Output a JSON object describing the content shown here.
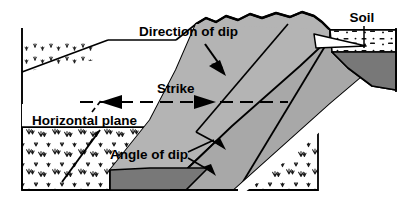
{
  "figure": {
    "type": "geologic-block-diagram",
    "width": 400,
    "height": 211
  },
  "labels": {
    "direction_of_dip": "Direction of dip",
    "strike": "Strike",
    "horizontal_plane": "Horizontal plane",
    "angle_of_dip": "Angle of dip",
    "soil": "Soil"
  },
  "colors": {
    "outline": "#000000",
    "background": "#ffffff",
    "bed_light_gray": "#b4b4b4",
    "bed_mid_gray": "#a8a8a8",
    "bed_dark_gray": "#787878",
    "soil_fill": "#ffffff",
    "text": "#000000"
  },
  "annotations": [
    {
      "name": "direction-of-dip",
      "text": "Direction of dip",
      "arrow": "down-right",
      "x": 139,
      "y": 32
    },
    {
      "name": "strike",
      "text": "Strike",
      "arrow": "double-horizontal",
      "x": 157,
      "y": 89
    },
    {
      "name": "horizontal-plane",
      "text": "Horizontal plane",
      "arrow": "dashed-leader-up-right",
      "x": 32,
      "y": 121
    },
    {
      "name": "angle-of-dip",
      "text": "Angle of dip",
      "arrow": "right-down",
      "x": 110,
      "y": 155
    },
    {
      "name": "soil",
      "text": "Soil",
      "arrow": "vertical-leader-down",
      "x": 362,
      "y": 18
    }
  ],
  "features": {
    "top_surface": "eroded wavy ridge crest",
    "bedding": "inclined planar beds dipping to the lower right",
    "ground_cover": "grass / vegetation hachure texture",
    "soil_layer": "stippled soil wedge at upper right"
  }
}
